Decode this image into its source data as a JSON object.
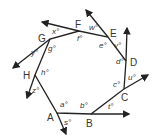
{
  "figure": {
    "type": "polygon-exterior-angles",
    "stroke_color": "#222222",
    "vertices": [
      {
        "label": "A",
        "x": 57,
        "y": 113,
        "lx": 47,
        "ly": 121
      },
      {
        "label": "B",
        "x": 91,
        "y": 114,
        "lx": 86,
        "ly": 127
      },
      {
        "label": "C",
        "x": 124,
        "y": 89,
        "lx": 121,
        "ly": 101
      },
      {
        "label": "D",
        "x": 126,
        "y": 61,
        "lx": 130,
        "ly": 66
      },
      {
        "label": "E",
        "x": 108,
        "y": 37,
        "lx": 110,
        "ly": 37
      },
      {
        "label": "F",
        "x": 79,
        "y": 31,
        "lx": 75,
        "ly": 28
      },
      {
        "label": "G",
        "x": 50,
        "y": 39,
        "lx": 38,
        "ly": 42
      },
      {
        "label": "H",
        "x": 35,
        "y": 75,
        "lx": 23,
        "ly": 79
      }
    ],
    "rays": [
      {
        "from": "A",
        "x1": 57,
        "y1": 113,
        "x2": 66,
        "y2": 134
      },
      {
        "from": "B",
        "x1": 91,
        "y1": 114,
        "x2": 129,
        "y2": 114
      },
      {
        "from": "C",
        "x1": 124,
        "y1": 89,
        "x2": 148,
        "y2": 75
      },
      {
        "from": "D",
        "x1": 126,
        "y1": 61,
        "x2": 127,
        "y2": 28
      },
      {
        "from": "E",
        "x1": 108,
        "y1": 37,
        "x2": 86,
        "y2": 10
      },
      {
        "from": "F",
        "x1": 79,
        "y1": 31,
        "x2": 42,
        "y2": 22
      },
      {
        "from": "G",
        "x1": 50,
        "y1": 39,
        "x2": 13,
        "y2": 68
      },
      {
        "from": "H",
        "x1": 35,
        "y1": 75,
        "x2": 27,
        "y2": 98
      }
    ],
    "interior_angles": [
      {
        "label": "a°",
        "x": 60,
        "y": 107
      },
      {
        "label": "b°",
        "x": 80,
        "y": 108
      },
      {
        "label": "c°",
        "x": 113,
        "y": 87
      },
      {
        "label": "d°",
        "x": 116,
        "y": 64
      },
      {
        "label": "e°",
        "x": 99,
        "y": 48
      },
      {
        "label": "f°",
        "x": 77,
        "y": 41
      },
      {
        "label": "g°",
        "x": 48,
        "y": 51
      },
      {
        "label": "h°",
        "x": 41,
        "y": 75
      }
    ],
    "exterior_angles": [
      {
        "label": "s°",
        "x": 64,
        "y": 125
      },
      {
        "label": "t°",
        "x": 108,
        "y": 109
      },
      {
        "label": "u°",
        "x": 128,
        "y": 80
      },
      {
        "label": "v°",
        "x": 114,
        "y": 48
      },
      {
        "label": "w°",
        "x": 89,
        "y": 30
      },
      {
        "label": "x°",
        "x": 52,
        "y": 34
      },
      {
        "label": "y°",
        "x": 31,
        "y": 55
      },
      {
        "label": "z°",
        "x": 32,
        "y": 93
      }
    ]
  }
}
